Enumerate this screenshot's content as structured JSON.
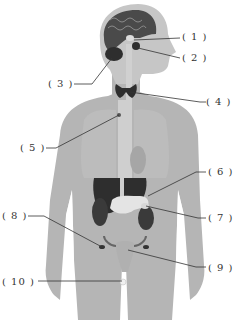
{
  "diagram": {
    "colors": {
      "body": "#b3b3b3",
      "body_light": "#c9c9c9",
      "brain": "#4a4a4a",
      "organ_dark": "#2e2e2e",
      "organ_light": "#e2e2e2",
      "leader_line": "#333333"
    },
    "labels": [
      {
        "id": 1,
        "text": "( 1 )"
      },
      {
        "id": 2,
        "text": "( 2 )"
      },
      {
        "id": 3,
        "text": "( 3 )"
      },
      {
        "id": 4,
        "text": "( 4 )"
      },
      {
        "id": 5,
        "text": "( 5 )"
      },
      {
        "id": 6,
        "text": "( 6 )"
      },
      {
        "id": 7,
        "text": "( 7 )"
      },
      {
        "id": 8,
        "text": "( 8 )"
      },
      {
        "id": 9,
        "text": "( 9 )"
      },
      {
        "id": 10,
        "text": "( 10 )"
      }
    ]
  }
}
